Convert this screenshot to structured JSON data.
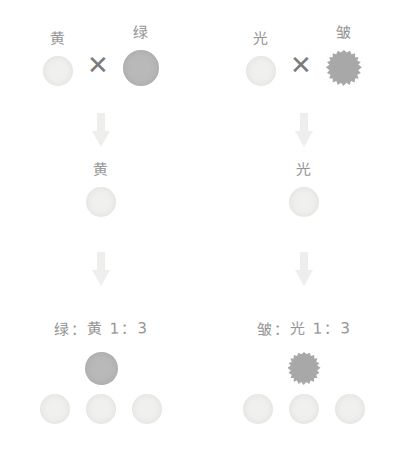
{
  "diagram": {
    "colors": {
      "pale_seed": "#f0f0ee",
      "dark_seed": "#b9b9b9",
      "wrinkled_seed": "#a8a8a8",
      "ink": "#8d8d8d",
      "arrow": "#eeeeec",
      "cross_symbol": "#7a7a7a",
      "background": "#ffffff"
    },
    "multiply_symbol": "✕",
    "arrow_symbol": "down-arrow",
    "panels": [
      {
        "id": "seed-color-cross",
        "parents": [
          {
            "label": "黄",
            "meaning": "yellow",
            "shape": "circle",
            "fill": "pale"
          },
          {
            "label": "绿",
            "meaning": "green",
            "shape": "circle",
            "fill": "dark"
          }
        ],
        "f1": {
          "label": "黄",
          "meaning": "yellow",
          "shape": "circle",
          "fill": "pale"
        },
        "f2": {
          "ratio_text": "绿：黄  1：3",
          "ratio_numerator_label": "绿",
          "ratio_denominator_label": "黄",
          "ratio_value": "1:3",
          "recessive_count": 1,
          "dominant_count": 3,
          "recessive_shape": {
            "shape": "circle",
            "fill": "dark"
          },
          "dominant_shape": {
            "shape": "circle",
            "fill": "pale"
          }
        }
      },
      {
        "id": "seed-shape-cross",
        "parents": [
          {
            "label": "光",
            "meaning": "smooth",
            "shape": "circle",
            "fill": "pale"
          },
          {
            "label": "皱",
            "meaning": "wrinkled",
            "shape": "wrinkled",
            "fill": "wrinkled"
          }
        ],
        "f1": {
          "label": "光",
          "meaning": "smooth",
          "shape": "circle",
          "fill": "pale"
        },
        "f2": {
          "ratio_text": "皱：光  1：3",
          "ratio_numerator_label": "皱",
          "ratio_denominator_label": "光",
          "ratio_value": "1:3",
          "recessive_count": 1,
          "dominant_count": 3,
          "recessive_shape": {
            "shape": "wrinkled",
            "fill": "wrinkled"
          },
          "dominant_shape": {
            "shape": "circle",
            "fill": "pale"
          }
        }
      }
    ]
  }
}
